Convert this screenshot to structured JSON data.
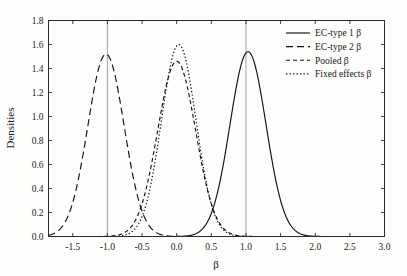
{
  "chart_data": {
    "type": "line",
    "title": "",
    "subtitle": "",
    "xlabel": "β",
    "ylabel": "Densities",
    "xlim": [
      -1.85,
      3.0
    ],
    "ylim": [
      0.0,
      1.8
    ],
    "grid": false,
    "legend_position": "top-right",
    "x_ticks": [
      -1.5,
      -1.0,
      -0.5,
      0.0,
      0.5,
      1.0,
      1.5,
      2.0,
      2.5,
      3.0
    ],
    "x_tick_labels": [
      "-1.5",
      "-1.0",
      "-0.5",
      "0.0",
      "0.5",
      "1.0",
      "1.5",
      "2.0",
      "2.5",
      "3.0"
    ],
    "y_ticks": [
      0.0,
      0.2,
      0.4,
      0.6,
      0.8,
      1.0,
      1.2,
      1.4,
      1.6,
      1.8
    ],
    "y_tick_labels": [
      "0.0",
      "0.2",
      "0.4",
      "0.6",
      "0.8",
      "1.0",
      "1.2",
      "1.4",
      "1.6",
      "1.8"
    ],
    "reference_lines": [
      {
        "x": -1.0,
        "orientation": "vertical"
      },
      {
        "x": 1.0,
        "orientation": "vertical"
      }
    ],
    "series": [
      {
        "name": "EC-type 1 β",
        "style": "solid",
        "color": "#111111",
        "distribution": "normal",
        "mean": 1.03,
        "sd": 0.26,
        "peak_value": 1.54,
        "peak_x": 1.03
      },
      {
        "name": "EC-type 2 β",
        "style": "long-dash",
        "color": "#111111",
        "distribution": "normal",
        "mean": -1.02,
        "sd": 0.262,
        "peak_value": 1.52,
        "peak_x": -1.02
      },
      {
        "name": "Pooled β",
        "style": "dash",
        "color": "#111111",
        "distribution": "normal",
        "mean": 0.0,
        "sd": 0.273,
        "peak_value": 1.46,
        "peak_x": 0.0
      },
      {
        "name": "Fixed effects β",
        "style": "dotted",
        "color": "#111111",
        "distribution": "normal",
        "mean": 0.03,
        "sd": 0.249,
        "peak_value": 1.6,
        "peak_x": 0.03
      }
    ]
  },
  "legend": {
    "entries": [
      {
        "label": "EC-type 1 β",
        "style": "solid"
      },
      {
        "label": "EC-type 2 β",
        "style": "long-dash"
      },
      {
        "label": "Pooled β",
        "style": "dash"
      },
      {
        "label": "Fixed effects β",
        "style": "dotted"
      }
    ]
  },
  "axes": {
    "x_title": "β",
    "y_title": "Densities"
  }
}
